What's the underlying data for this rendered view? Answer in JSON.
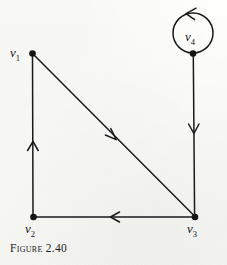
{
  "figure": {
    "caption": "Figure 2.40",
    "type": "directed-graph-diagram",
    "ink_color": "#1a1a1d",
    "background_color": "#fdfdfb"
  },
  "graph": {
    "vertices": [
      {
        "id": "v1",
        "label": "v",
        "subscript": "1",
        "x": 32,
        "y": 53,
        "label_x": 10,
        "label_y": 46
      },
      {
        "id": "v2",
        "label": "v",
        "subscript": "2",
        "x": 33,
        "y": 217,
        "label_x": 25,
        "label_y": 222
      },
      {
        "id": "v3",
        "label": "v",
        "subscript": "3",
        "x": 195,
        "y": 217,
        "label_x": 187,
        "label_y": 222
      },
      {
        "id": "v4",
        "label": "v",
        "subscript": "4",
        "x": 193,
        "y": 53,
        "label_x": 185,
        "label_y": 30
      }
    ],
    "edges": [
      {
        "id": "e-v2-v1",
        "from": "v2",
        "to": "v1",
        "kind": "straight",
        "arrow_direction": "up",
        "arrow_x": 33,
        "arrow_y": 143
      },
      {
        "id": "e-v1-v3",
        "from": "v1",
        "to": "v3",
        "kind": "straight",
        "arrow_direction": "down-right",
        "arrow_x": 113,
        "arrow_y": 136
      },
      {
        "id": "e-v3-v2",
        "from": "v3",
        "to": "v2",
        "kind": "straight",
        "arrow_direction": "left",
        "arrow_x": 113,
        "arrow_y": 217
      },
      {
        "id": "e-v4-v3",
        "from": "v4",
        "to": "v3",
        "kind": "straight",
        "arrow_direction": "down",
        "arrow_x": 193,
        "arrow_y": 130
      },
      {
        "id": "e-v4-v4",
        "from": "v4",
        "to": "v4",
        "kind": "self-loop",
        "arrow_direction": "counterclockwise",
        "loop_center_x": 193,
        "loop_center_y": 33,
        "loop_radius": 20
      }
    ]
  }
}
